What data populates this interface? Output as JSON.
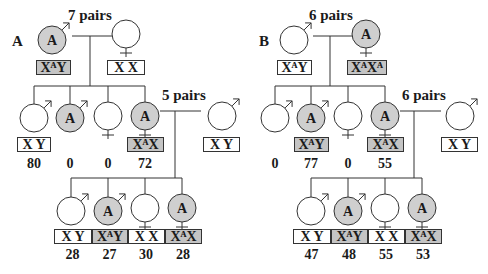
{
  "figure": {
    "colors": {
      "affected_fill": "#cfcfcf",
      "affected_box": "#c4c4c4",
      "line": "#333333",
      "text": "#1a1a1a"
    },
    "panels": [
      {
        "id": "A",
        "label": "A",
        "label_pos": [
          12,
          46
        ],
        "parents": {
          "pairs_label": "7 pairs",
          "pairs_pos": [
            68,
            20
          ],
          "father": {
            "sex": "male",
            "affected": true,
            "allele": "A",
            "cx": 52,
            "cy": 40,
            "genotype": "XᴬY",
            "box": [
              36,
              60,
              34,
              14
            ],
            "box_affected": true
          },
          "mother": {
            "sex": "female",
            "affected": false,
            "allele": "",
            "cx": 126,
            "cy": 34,
            "genotype": "X X",
            "box": [
              107,
              60,
              37,
              14
            ],
            "box_affected": false
          },
          "marriage_line": [
            72,
            36,
            112,
            36
          ],
          "drop_line": [
            90,
            36,
            90,
            86
          ]
        },
        "sibship1": {
          "line": [
            34,
            86,
            145,
            86
          ],
          "children": [
            {
              "sex": "male",
              "affected": false,
              "allele": "",
              "cx": 34,
              "cy": 118,
              "genotype": "X Y",
              "box": [
                17,
                137,
                33,
                14
              ],
              "box_affected": false,
              "count": "80"
            },
            {
              "sex": "male",
              "affected": true,
              "allele": "A",
              "cx": 70,
              "cy": 118,
              "genotype": "",
              "box": null,
              "box_affected": false,
              "count": "0"
            },
            {
              "sex": "female",
              "affected": false,
              "allele": "",
              "cx": 108,
              "cy": 116,
              "genotype": "",
              "box": null,
              "box_affected": false,
              "count": "0"
            },
            {
              "sex": "female",
              "affected": true,
              "allele": "A",
              "cx": 145,
              "cy": 116,
              "genotype": "XᴬX",
              "box": [
                127,
                137,
                36,
                14
              ],
              "box_affected": true,
              "count": "72"
            }
          ]
        },
        "second_mating": {
          "pairs_label": "5 pairs",
          "pairs_pos": [
            162,
            100
          ],
          "marriage_line": [
            160,
            111,
            201,
            111
          ],
          "drop_line": [
            175,
            111,
            175,
            178
          ],
          "spouse": {
            "sex": "male",
            "affected": false,
            "allele": "",
            "cx": 222,
            "cy": 116,
            "genotype": "X Y",
            "box": [
              203,
              137,
              36,
              14
            ],
            "box_affected": false
          }
        },
        "sibship2": {
          "line": [
            71,
            178,
            182,
            178
          ],
          "children": [
            {
              "sex": "male",
              "affected": false,
              "allele": "",
              "cx": 71,
              "cy": 211,
              "genotype": "X Y",
              "box": [
                54,
                229,
                37,
                14
              ],
              "box_affected": false,
              "count": "28"
            },
            {
              "sex": "male",
              "affected": true,
              "allele": "A",
              "cx": 108,
              "cy": 211,
              "genotype": "XᴬY",
              "box": [
                92,
                229,
                35,
                14
              ],
              "box_affected": true,
              "count": "27"
            },
            {
              "sex": "female",
              "affected": false,
              "allele": "",
              "cx": 145,
              "cy": 208,
              "genotype": "X X",
              "box": [
                128,
                229,
                36,
                14
              ],
              "box_affected": false,
              "count": "30"
            },
            {
              "sex": "female",
              "affected": true,
              "allele": "A",
              "cx": 182,
              "cy": 208,
              "genotype": "XᴬX",
              "box": [
                165,
                229,
                36,
                14
              ],
              "box_affected": true,
              "count": "28"
            }
          ]
        }
      },
      {
        "id": "B",
        "label": "B",
        "label_pos": [
          259,
          46
        ],
        "parents": {
          "pairs_label": "6 pairs",
          "pairs_pos": [
            309,
            20
          ],
          "father": {
            "sex": "male",
            "affected": false,
            "allele": "",
            "cx": 294,
            "cy": 40,
            "genotype": "XᴬY",
            "box": [
              277,
              60,
              34,
              14
            ],
            "box_affected": false
          },
          "mother": {
            "sex": "female",
            "affected": true,
            "allele": "A",
            "cx": 366,
            "cy": 34,
            "genotype": "XᴬXᴬ",
            "box": [
              347,
              60,
              39,
              14
            ],
            "box_affected": true
          },
          "marriage_line": [
            313,
            36,
            352,
            36
          ],
          "drop_line": [
            330,
            36,
            330,
            86
          ]
        },
        "sibship1": {
          "line": [
            275,
            86,
            385,
            86
          ],
          "children": [
            {
              "sex": "male",
              "affected": false,
              "allele": "",
              "cx": 275,
              "cy": 118,
              "genotype": "",
              "box": null,
              "box_affected": false,
              "count": "0"
            },
            {
              "sex": "male",
              "affected": true,
              "allele": "A",
              "cx": 311,
              "cy": 118,
              "genotype": "XᴬY",
              "box": [
                294,
                137,
                34,
                14
              ],
              "box_affected": true,
              "count": "77"
            },
            {
              "sex": "female",
              "affected": false,
              "allele": "",
              "cx": 348,
              "cy": 116,
              "genotype": "",
              "box": null,
              "box_affected": false,
              "count": "0"
            },
            {
              "sex": "female",
              "affected": true,
              "allele": "A",
              "cx": 385,
              "cy": 116,
              "genotype": "XᴬX",
              "box": [
                367,
                137,
                36,
                14
              ],
              "box_affected": true,
              "count": "55"
            }
          ]
        },
        "second_mating": {
          "pairs_label": "6 pairs",
          "pairs_pos": [
            402,
            100
          ],
          "marriage_line": [
            400,
            111,
            441,
            111
          ],
          "drop_line": [
            414,
            111,
            414,
            178
          ],
          "spouse": {
            "sex": "male",
            "affected": false,
            "allele": "",
            "cx": 460,
            "cy": 116,
            "genotype": "X Y",
            "box": [
              441,
              137,
              36,
              14
            ],
            "box_affected": false
          }
        },
        "sibship2": {
          "line": [
            311,
            178,
            422,
            178
          ],
          "children": [
            {
              "sex": "male",
              "affected": false,
              "allele": "",
              "cx": 311,
              "cy": 211,
              "genotype": "X Y",
              "box": [
                293,
                229,
                37,
                14
              ],
              "box_affected": false,
              "count": "47"
            },
            {
              "sex": "male",
              "affected": true,
              "allele": "A",
              "cx": 348,
              "cy": 211,
              "genotype": "XᴬY",
              "box": [
                331,
                229,
                36,
                14
              ],
              "box_affected": true,
              "count": "48"
            },
            {
              "sex": "female",
              "affected": false,
              "allele": "",
              "cx": 385,
              "cy": 208,
              "genotype": "X X",
              "box": [
                368,
                229,
                36,
                14
              ],
              "box_affected": false,
              "count": "55"
            },
            {
              "sex": "female",
              "affected": true,
              "allele": "A",
              "cx": 422,
              "cy": 208,
              "genotype": "XᴬX",
              "box": [
                405,
                229,
                36,
                14
              ],
              "box_affected": true,
              "count": "53"
            }
          ]
        }
      }
    ]
  }
}
